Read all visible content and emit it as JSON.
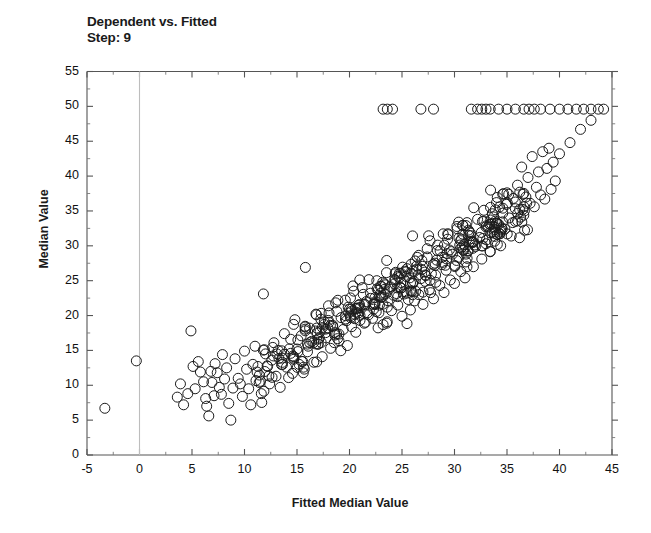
{
  "chart_data": {
    "type": "scatter",
    "title": "Dependent vs. Fitted",
    "subtitle": "Step: 9",
    "xlabel": "Fitted Median Value",
    "ylabel": "Median Value",
    "xlim": [
      -5,
      45
    ],
    "ylim": [
      0,
      55
    ],
    "xticks": [
      -5,
      0,
      5,
      10,
      15,
      20,
      25,
      30,
      35,
      40,
      45
    ],
    "ytleft_ticks": [
      0,
      5,
      10,
      15,
      20,
      25,
      30,
      35,
      40,
      45,
      50,
      55
    ],
    "xtick_labels": [
      "-5",
      "0",
      "5",
      "10",
      "15",
      "20",
      "25",
      "30",
      "35",
      "40",
      "45"
    ],
    "ytick_labels": [
      "0",
      "5",
      "10",
      "15",
      "20",
      "25",
      "30",
      "35",
      "40",
      "45",
      "50",
      "55"
    ],
    "minor_tick_step": 2.5,
    "grid": false,
    "legend": null,
    "marker": "open-circle",
    "marker_size_px": 10,
    "marker_color": "#1b1b1b",
    "reference_line_x": 0,
    "reference_line_color": "#bdbdbd",
    "n_points": 506,
    "series": [
      {
        "name": "observations",
        "points": [
          [
            -3.3,
            6.7
          ],
          [
            -0.3,
            13.5
          ],
          [
            3.6,
            8.3
          ],
          [
            3.9,
            10.2
          ],
          [
            4.2,
            7.2
          ],
          [
            4.6,
            8.8
          ],
          [
            4.9,
            17.8
          ],
          [
            5.1,
            12.7
          ],
          [
            5.3,
            9.5
          ],
          [
            5.6,
            13.4
          ],
          [
            5.8,
            11.9
          ],
          [
            6.1,
            10.5
          ],
          [
            6.3,
            8.1
          ],
          [
            6.4,
            7.0
          ],
          [
            6.6,
            5.6
          ],
          [
            6.8,
            12.0
          ],
          [
            6.9,
            10.4
          ],
          [
            7.1,
            8.5
          ],
          [
            7.2,
            13.1
          ],
          [
            7.4,
            11.8
          ],
          [
            7.6,
            9.7
          ],
          [
            7.8,
            8.7
          ],
          [
            7.9,
            14.4
          ],
          [
            8.1,
            10.9
          ],
          [
            8.3,
            12.5
          ],
          [
            8.5,
            7.4
          ],
          [
            8.7,
            5.0
          ],
          [
            8.9,
            9.6
          ],
          [
            9.1,
            13.8
          ],
          [
            9.4,
            11.0
          ],
          [
            9.6,
            10.2
          ],
          [
            9.8,
            8.4
          ],
          [
            10.0,
            14.9
          ],
          [
            10.2,
            12.3
          ],
          [
            10.4,
            9.5
          ],
          [
            10.6,
            7.2
          ],
          [
            10.8,
            13.0
          ],
          [
            11.0,
            15.6
          ],
          [
            11.2,
            11.9
          ],
          [
            11.4,
            10.4
          ],
          [
            11.6,
            8.8
          ],
          [
            11.8,
            23.1
          ],
          [
            12.0,
            14.5
          ],
          [
            12.2,
            12.7
          ],
          [
            12.4,
            10.2
          ],
          [
            12.6,
            13.6
          ],
          [
            12.8,
            16.1
          ],
          [
            13.0,
            11.3
          ],
          [
            13.2,
            15.0
          ],
          [
            13.4,
            9.7
          ],
          [
            13.6,
            13.9
          ],
          [
            13.8,
            17.4
          ],
          [
            14.0,
            12.6
          ],
          [
            14.2,
            11.1
          ],
          [
            14.4,
            16.6
          ],
          [
            14.6,
            14.2
          ],
          [
            14.8,
            19.4
          ],
          [
            15.0,
            15.2
          ],
          [
            15.2,
            13.0
          ],
          [
            15.4,
            17.1
          ],
          [
            15.6,
            11.8
          ],
          [
            15.8,
            26.9
          ],
          [
            16.0,
            14.8
          ],
          [
            16.2,
            18.2
          ],
          [
            16.4,
            16.3
          ],
          [
            16.6,
            13.3
          ],
          [
            16.8,
            20.2
          ],
          [
            17.0,
            15.9
          ],
          [
            17.2,
            17.7
          ],
          [
            17.4,
            14.1
          ],
          [
            17.6,
            19.1
          ],
          [
            17.8,
            16.8
          ],
          [
            18.0,
            21.4
          ],
          [
            18.2,
            15.3
          ],
          [
            18.4,
            18.6
          ],
          [
            18.6,
            17.2
          ],
          [
            18.8,
            20.6
          ],
          [
            19.0,
            16.4
          ],
          [
            19.2,
            19.7
          ],
          [
            19.4,
            18.0
          ],
          [
            19.6,
            22.2
          ],
          [
            19.8,
            15.7
          ],
          [
            20.0,
            20.9
          ],
          [
            20.2,
            18.4
          ],
          [
            20.4,
            23.5
          ],
          [
            20.6,
            17.6
          ],
          [
            20.8,
            21.1
          ],
          [
            21.0,
            19.3
          ],
          [
            21.2,
            24.0
          ],
          [
            21.4,
            18.9
          ],
          [
            21.6,
            22.0
          ],
          [
            21.8,
            20.1
          ],
          [
            22.0,
            23.2
          ],
          [
            22.2,
            19.6
          ],
          [
            22.4,
            21.7
          ],
          [
            22.6,
            25.0
          ],
          [
            22.8,
            20.4
          ],
          [
            23.0,
            22.6
          ],
          [
            23.2,
            18.7
          ],
          [
            23.4,
            24.4
          ],
          [
            23.6,
            21.2
          ],
          [
            23.8,
            23.8
          ],
          [
            24.0,
            20.7
          ],
          [
            24.2,
            22.9
          ],
          [
            24.4,
            26.2
          ],
          [
            24.6,
            21.5
          ],
          [
            24.8,
            24.1
          ],
          [
            25.0,
            19.9
          ],
          [
            25.2,
            23.4
          ],
          [
            25.4,
            25.6
          ],
          [
            25.6,
            22.3
          ],
          [
            25.8,
            20.8
          ],
          [
            26.0,
            24.7
          ],
          [
            26.2,
            22.1
          ],
          [
            26.4,
            27.1
          ],
          [
            26.6,
            23.0
          ],
          [
            26.8,
            25.3
          ],
          [
            27.0,
            21.6
          ],
          [
            27.2,
            24.9
          ],
          [
            27.4,
            28.4
          ],
          [
            27.6,
            23.7
          ],
          [
            27.8,
            26.0
          ],
          [
            28.0,
            22.4
          ],
          [
            28.2,
            25.8
          ],
          [
            28.4,
            30.1
          ],
          [
            28.6,
            24.3
          ],
          [
            28.8,
            27.3
          ],
          [
            29.0,
            23.3
          ],
          [
            29.2,
            26.5
          ],
          [
            29.4,
            31.6
          ],
          [
            29.6,
            25.1
          ],
          [
            29.8,
            28.8
          ],
          [
            30.0,
            24.6
          ],
          [
            30.2,
            27.9
          ],
          [
            30.4,
            33.4
          ],
          [
            30.6,
            26.3
          ],
          [
            30.8,
            29.4
          ],
          [
            31.0,
            25.4
          ],
          [
            31.2,
            28.2
          ],
          [
            31.4,
            32.0
          ],
          [
            31.6,
            30.6
          ],
          [
            31.8,
            27.0
          ],
          [
            32.0,
            29.9
          ],
          [
            32.2,
            33.8
          ],
          [
            32.4,
            31.2
          ],
          [
            32.6,
            28.1
          ],
          [
            32.8,
            35.1
          ],
          [
            33.0,
            30.3
          ],
          [
            33.2,
            32.7
          ],
          [
            33.4,
            29.2
          ],
          [
            33.6,
            34.6
          ],
          [
            33.8,
            31.8
          ],
          [
            34.0,
            36.2
          ],
          [
            34.2,
            33.1
          ],
          [
            34.4,
            30.0
          ],
          [
            34.6,
            35.4
          ],
          [
            34.8,
            32.4
          ],
          [
            35.0,
            37.6
          ],
          [
            35.2,
            34.0
          ],
          [
            35.4,
            31.4
          ],
          [
            35.6,
            36.8
          ],
          [
            35.8,
            33.5
          ],
          [
            36.0,
            38.7
          ],
          [
            36.2,
            35.2
          ],
          [
            36.4,
            41.3
          ],
          [
            36.6,
            34.4
          ],
          [
            36.8,
            37.0
          ],
          [
            37.0,
            39.8
          ],
          [
            37.2,
            36.1
          ],
          [
            37.4,
            42.8
          ],
          [
            37.6,
            35.6
          ],
          [
            37.8,
            38.4
          ],
          [
            38.0,
            40.6
          ],
          [
            38.2,
            37.3
          ],
          [
            38.4,
            43.5
          ],
          [
            38.6,
            36.7
          ],
          [
            38.8,
            41.1
          ],
          [
            39.0,
            44.0
          ],
          [
            39.2,
            38.1
          ],
          [
            39.4,
            42.0
          ],
          [
            39.6,
            39.3
          ],
          [
            40.0,
            43.2
          ],
          [
            41.0,
            44.8
          ],
          [
            42.0,
            46.7
          ],
          [
            43.0,
            48.0
          ],
          [
            23.2,
            49.6
          ],
          [
            23.6,
            49.6
          ],
          [
            24.1,
            49.6
          ],
          [
            26.8,
            49.6
          ],
          [
            28.0,
            49.6
          ],
          [
            31.6,
            49.6
          ],
          [
            32.2,
            49.6
          ],
          [
            32.6,
            49.6
          ],
          [
            33.0,
            49.6
          ],
          [
            33.4,
            49.6
          ],
          [
            34.2,
            49.6
          ],
          [
            35.0,
            49.6
          ],
          [
            35.8,
            49.6
          ],
          [
            36.6,
            49.6
          ],
          [
            37.1,
            49.6
          ],
          [
            37.6,
            49.6
          ],
          [
            38.2,
            49.6
          ],
          [
            39.1,
            49.6
          ],
          [
            40.0,
            49.6
          ],
          [
            40.8,
            49.6
          ],
          [
            41.6,
            49.6
          ],
          [
            42.3,
            49.6
          ],
          [
            43.0,
            49.6
          ],
          [
            43.7,
            49.6
          ],
          [
            44.2,
            49.6
          ]
        ]
      }
    ]
  }
}
